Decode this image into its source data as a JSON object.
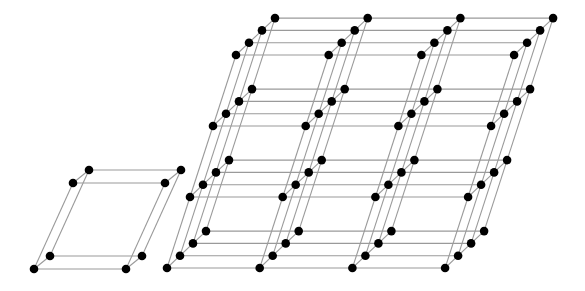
{
  "figure": {
    "colors": {
      "background": "#ffffff",
      "edge": "#9a9a9a",
      "atom": "#000000"
    },
    "atom_radius": 4.3
  },
  "unit_cell": {
    "label": "unit-cell",
    "origin": [
      34,
      269
    ],
    "a": [
      92,
      0
    ],
    "b": [
      39,
      -86
    ],
    "c": [
      16,
      -13
    ],
    "counts": [
      1,
      1,
      1
    ]
  },
  "lattice": {
    "label": "crystal-lattice",
    "origin": [
      167,
      268
    ],
    "a": [
      92.7,
      0
    ],
    "b": [
      23,
      -71
    ],
    "c": [
      13,
      -12.3
    ],
    "counts": [
      3,
      3,
      3
    ]
  }
}
